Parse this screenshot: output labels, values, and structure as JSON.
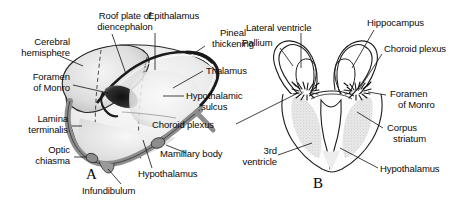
{
  "figure": {
    "panel_a_letter": "A",
    "panel_b_letter": "B",
    "background_color": "#ffffff",
    "ink_color": "#111111",
    "mantle_gray": "#8f8f8f",
    "shade_light": "#dcdcdc"
  },
  "panel_a": {
    "letter": "A",
    "labels": [
      {
        "id": "roof-plate-of-diencephalon",
        "line1": "Roof plate of",
        "line2": "diencephalon"
      },
      {
        "id": "epithalamus",
        "line1": "Epithalamus"
      },
      {
        "id": "pineal-thickening",
        "line1": "Pineal",
        "line2": "thickening"
      },
      {
        "id": "cerebral-hemisphere",
        "line1": "Cerebral",
        "line2": "hemisphere"
      },
      {
        "id": "foramen-of-monro",
        "line1": "Foramen",
        "line2": "of Monro"
      },
      {
        "id": "lamina-terminalis",
        "line1": "Lamina",
        "line2": "terminalis"
      },
      {
        "id": "optic-chiasma",
        "line1": "Optic",
        "line2": "chiasma"
      },
      {
        "id": "infundibulum",
        "line1": "Infundibulum"
      },
      {
        "id": "hypothalamus",
        "line1": "Hypothalamus"
      },
      {
        "id": "mamillary-body",
        "line1": "Mamillary body"
      },
      {
        "id": "thalamus",
        "line1": "Thalamus"
      },
      {
        "id": "hypothalamic-sulcus",
        "line1": "Hypothalamic",
        "line2": "sulcus"
      },
      {
        "id": "choroid-plexus",
        "line1": "Choroid plexus"
      }
    ]
  },
  "panel_b": {
    "letter": "B",
    "labels": [
      {
        "id": "lateral-ventricle",
        "line1": "Lateral ventricle"
      },
      {
        "id": "pallium",
        "line1": "Pallium"
      },
      {
        "id": "hippocampus",
        "line1": "Hippocampus"
      },
      {
        "id": "choroid-plexus",
        "line1": "Choroid plexus"
      },
      {
        "id": "foramen-of-monro",
        "line1": "Foramen",
        "line2": "of Monro"
      },
      {
        "id": "corpus-striatum",
        "line1": "Corpus",
        "line2": "striatum"
      },
      {
        "id": "hypothalamus",
        "line1": "Hypothalamus"
      },
      {
        "id": "third-ventricle",
        "line1": "3rd",
        "line2": "ventricle"
      }
    ]
  }
}
